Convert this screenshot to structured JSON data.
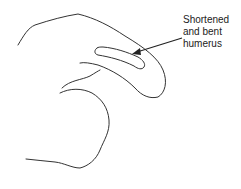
{
  "diagram": {
    "type": "anatomical-line-drawing",
    "annotation": {
      "lines": [
        "Shortened",
        "and bent",
        "humerus"
      ]
    },
    "colors": {
      "stroke": "#333333",
      "text": "#222222",
      "background": "#ffffff"
    }
  }
}
